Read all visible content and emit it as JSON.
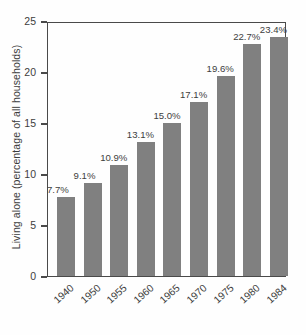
{
  "chart_data": {
    "type": "bar",
    "title": "",
    "subtitle": "",
    "xlabel": "",
    "ylabel": "Living alone (percentage of all households)",
    "categories": [
      "1940",
      "1950",
      "1955",
      "1960",
      "1965",
      "1970",
      "1975",
      "1980",
      "1984"
    ],
    "values": [
      7.7,
      9.1,
      10.9,
      13.1,
      15.0,
      17.1,
      19.6,
      22.7,
      23.4
    ],
    "point_labels": [
      "7.7%",
      "9.1%",
      "10.9%",
      "13.1%",
      "15.0%",
      "17.1%",
      "19.6%",
      "22.7%",
      "23.4%"
    ],
    "ylim": [
      0,
      25
    ],
    "yticks": [
      0,
      5,
      10,
      15,
      20,
      25
    ],
    "ytick_labels": [
      "0",
      "5",
      "10",
      "15",
      "20",
      "25"
    ],
    "grid": false,
    "legend": null,
    "bar_color": "#808080",
    "axis_color": "#4a4a4a",
    "text_color": "#3d3d3d",
    "background": "#fefefe"
  }
}
